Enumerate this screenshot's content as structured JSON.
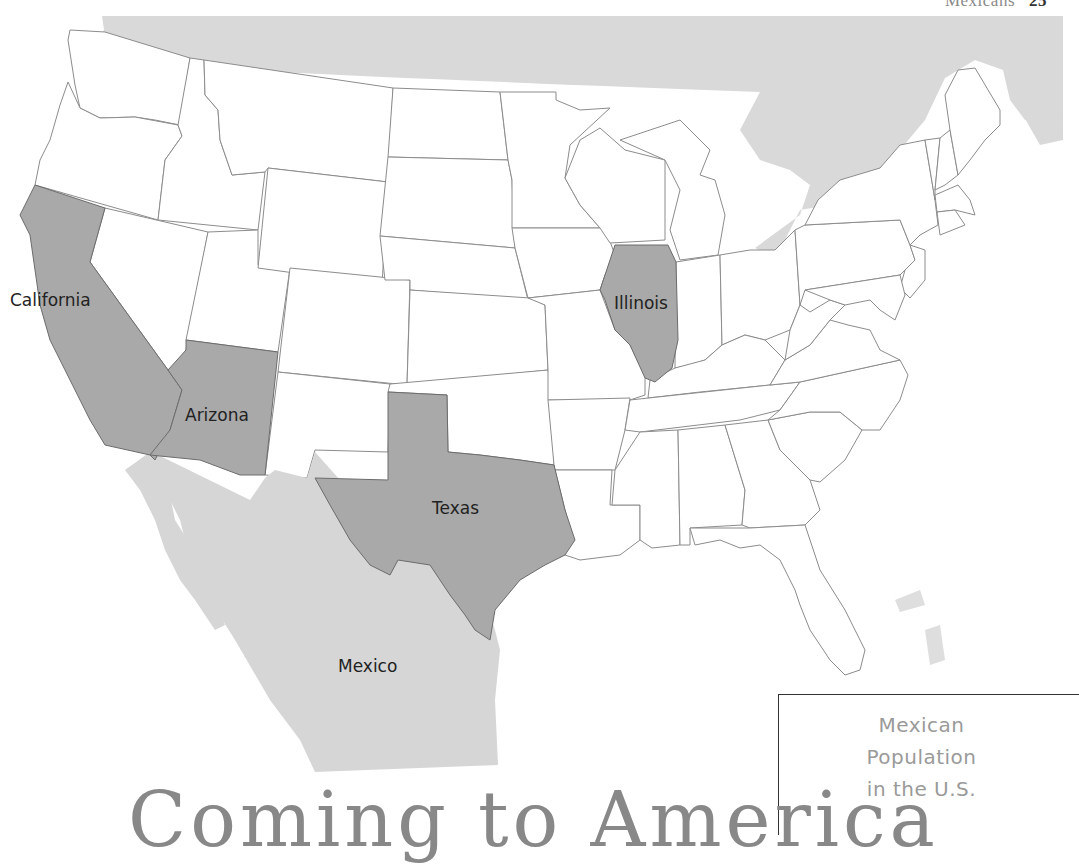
{
  "running_head": {
    "title": "Mexicans",
    "page_number": "25"
  },
  "map": {
    "colors": {
      "background": "#ffffff",
      "canada": "#d9d9d9",
      "mexico": "#d6d6d6",
      "highlighted_state": "#a9a9a9",
      "state_fill": "#ffffff",
      "border": "#8c8c8c"
    },
    "highlighted_states": [
      "California",
      "Arizona",
      "Texas",
      "Illinois"
    ],
    "labels": {
      "california": "California",
      "arizona": "Arizona",
      "texas": "Texas",
      "illinois": "Illinois",
      "mexico": "Mexico"
    }
  },
  "legend": {
    "title_line1": "Mexican",
    "title_line2": "Population",
    "title_line3": "in the U.S."
  },
  "chapter_heading": "Coming to America"
}
